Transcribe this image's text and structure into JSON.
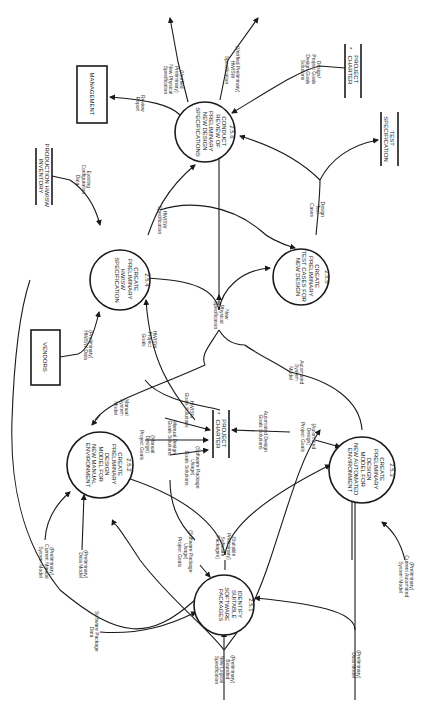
{
  "diagram": {
    "type": "data-flow-diagram",
    "orientation": "rotated-90-ccw",
    "processes": [
      {
        "id": "2.5.1",
        "lines": [
          "IDENTIFY",
          "SUITABLE",
          "SOFTWARE",
          "PACKAGES"
        ],
        "number": "2.5.1"
      },
      {
        "id": "2.5.2",
        "lines": [
          "CREATE",
          "PRELIMINARY",
          "DESIGN",
          "MODEL FOR",
          "NEW MANUAL",
          "ENVIRONMENT"
        ],
        "number": "2.5.2"
      },
      {
        "id": "2.5.3",
        "lines": [
          "CREATE",
          "PRELIMINARY",
          "DESIGN",
          "MODEL FOR",
          "NEW AUTOMATED",
          "ENVIRONMENT"
        ],
        "number": "2.5.3"
      },
      {
        "id": "2.5.4",
        "lines": [
          "CREATE",
          "PRELIMINARY",
          "HW/SW",
          "SPECIFICATION"
        ],
        "number": "2.5.4"
      },
      {
        "id": "2.5.5",
        "lines": [
          "CREATE",
          "PRELIMINARY",
          "TEST CASES FOR",
          "NEW DESIGN"
        ],
        "number": "2.5.5"
      },
      {
        "id": "2.5.6",
        "lines": [
          "CONDUCT",
          "REVIEW OF",
          "PRELIMINARY",
          "NEW DESIGN",
          "SPECIFICATIONS"
        ],
        "number": "2.5.6"
      }
    ],
    "externals": [
      {
        "id": "vendors",
        "label": "VENDORS"
      },
      {
        "id": "management",
        "label": "MANAGEMENT"
      }
    ],
    "stores": [
      {
        "id": "charter-center",
        "lines": [
          "PROJECT",
          "CHARTER"
        ],
        "mark": "*"
      },
      {
        "id": "charter-right",
        "lines": [
          "PROJECT",
          "CHARTER"
        ],
        "mark": "*"
      },
      {
        "id": "inventory",
        "lines": [
          "PRODUCTION HW/SW",
          "INVENTORY"
        ]
      },
      {
        "id": "testspec",
        "lines": [
          "TEST",
          "SPECIFICATION"
        ]
      }
    ],
    "flows": {
      "bounded_logical": [
        "(Preliminary)",
        "Bounded",
        "New Logical",
        "Specification"
      ],
      "data_model_bottom": [
        "(Preliminary)",
        "Data Model"
      ],
      "sw_package_data": [
        "Software Package",
        "Data"
      ],
      "current_manual": [
        "(Preliminary)",
        "Current Manual",
        "System Model"
      ],
      "data_model_left": [
        "(Preliminary)",
        "Data Model"
      ],
      "current_automated": [
        "(Preliminary)",
        "Current Automated",
        "System Model"
      ],
      "suitable_packages": [
        "(Suitable",
        "Preliminary)",
        "Software",
        "Packages)"
      ],
      "sw_usage_goals": [
        "(Software Package",
        "Usage)",
        "Project Goals"
      ],
      "sw_usage_solutions": [
        "(Software Package",
        "Usage)",
        "Goals Solutions"
      ],
      "manual_design_goals": [
        "(Manual",
        "Design)",
        "Project Goals"
      ],
      "manual_design_solutions": [
        "Manual Design",
        "Goals Solutions"
      ],
      "hwsw_goals_solutions": [
        "HW/SW",
        "Goals Solutions"
      ],
      "manual_system_model": [
        "Manual",
        "System",
        "Model"
      ],
      "auto_design_solutions": [
        "Automated Design",
        "Goals Solutions"
      ],
      "auto_design_goals": [
        "(Automated",
        "Design)",
        "Project Goals"
      ],
      "auto_system_model": [
        "Automated",
        "System",
        "Model"
      ],
      "new_physical_spec": [
        "New",
        "Physical",
        "Specification"
      ],
      "hwsw_project_goals": [
        "HW/SW",
        "Project",
        "Goals"
      ],
      "hwsw_data": [
        "(Preliminary)",
        "HW/SW Data"
      ],
      "hwsw_spec": [
        "HW/SW",
        "Specification"
      ],
      "existing_config": [
        "Existing",
        "Configuration",
        "Data"
      ],
      "design_test_cases": [
        "Design",
        "Test",
        "Cases"
      ],
      "review_report": [
        "Review",
        "Report"
      ],
      "verified_physical": [
        "(Verified",
        "Preliminary)",
        "New Physical",
        "Specification"
      ],
      "verified_hwsw": [
        "(Verified Preliminary)",
        "HW/SW",
        "Specification"
      ],
      "design_goals_solutions": [
        "Design/",
        "Project Goals",
        "Design Goals",
        "Solutions"
      ]
    }
  }
}
